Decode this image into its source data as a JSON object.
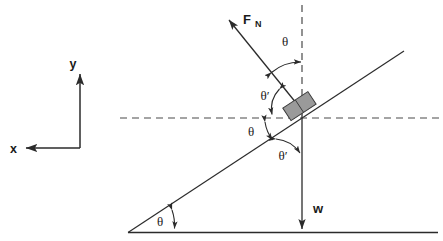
{
  "figure": {
    "type": "physics-free-body-diagram"
  },
  "colors": {
    "stroke": "#2b2b2b",
    "dashed": "#4a4a4a",
    "block_fill": "#9a9a9a",
    "block_stroke": "#3a3a3a",
    "background": "#ffffff"
  },
  "axes": {
    "y_label": "y",
    "x_label": "x",
    "y_direction": "up",
    "x_direction": "left"
  },
  "vectors": [
    {
      "name": "normal-force",
      "label": "F",
      "subscript": "N",
      "direction": "up-left, perpendicular to incline"
    },
    {
      "name": "weight",
      "label": "w",
      "subscript": "",
      "direction": "straight down"
    }
  ],
  "angles": [
    {
      "name": "angle-normal-vertical",
      "label": "θ",
      "location": "between normal force and vertical dashed line"
    },
    {
      "name": "angle-normal-horizontal",
      "label": "θ′",
      "location": "between normal force and horizontal dashed line"
    },
    {
      "name": "angle-incline-horizontal",
      "label": "θ",
      "location": "between incline surface and horizontal dashed line"
    },
    {
      "name": "angle-incline-weight",
      "label": "θ′",
      "location": "between incline surface and weight line"
    },
    {
      "name": "angle-incline-ground",
      "label": "θ",
      "location": "incline angle at base with ground"
    }
  ],
  "elements": {
    "block": "block-on-incline",
    "incline": "inclined-plane-surface",
    "ground": "ground-line",
    "horizontal_dashed": "horizontal-reference-line",
    "vertical_dashed": "vertical-reference-line"
  }
}
